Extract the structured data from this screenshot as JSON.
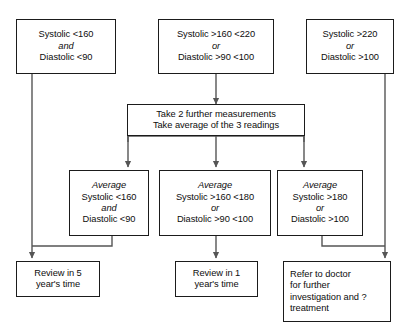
{
  "diagram": {
    "line_color": "#555555",
    "box_border_color": "#1b1b1b",
    "background": "#ffffff"
  },
  "nodes": {
    "bp_low": {
      "id": "bp-low-criteria-box",
      "lines": [
        {
          "text": "Systolic <160",
          "italic": false
        },
        {
          "text": "and",
          "italic": true
        },
        {
          "text": "Diastolic <90",
          "italic": false
        }
      ]
    },
    "bp_mid": {
      "id": "bp-moderate-criteria-box",
      "lines": [
        {
          "text": "Systolic >160 <220",
          "italic": false
        },
        {
          "text": "or",
          "italic": true
        },
        {
          "text": "Diastolic >90 <100",
          "italic": false
        }
      ]
    },
    "bp_high": {
      "id": "bp-high-criteria-box",
      "lines": [
        {
          "text": "Systolic >220",
          "italic": false
        },
        {
          "text": "or",
          "italic": true
        },
        {
          "text": "Diastolic >100",
          "italic": false
        }
      ]
    },
    "further": {
      "id": "take-further-measurements-box",
      "lines": [
        {
          "text": "Take 2 further measurements",
          "italic": false
        },
        {
          "text": "Take average of the 3 readings",
          "italic": false
        }
      ]
    },
    "avg_low": {
      "id": "average-low-box",
      "lines": [
        {
          "text": "Average",
          "italic": true
        },
        {
          "text": "Systolic <160",
          "italic": false
        },
        {
          "text": "and",
          "italic": true
        },
        {
          "text": "Diastolic <90",
          "italic": false
        }
      ]
    },
    "avg_mid": {
      "id": "average-moderate-box",
      "lines": [
        {
          "text": "Average",
          "italic": true
        },
        {
          "text": "Systolic >160 <180",
          "italic": false
        },
        {
          "text": "or",
          "italic": true
        },
        {
          "text": "Diastolic >90 <100",
          "italic": false
        }
      ]
    },
    "avg_high": {
      "id": "average-high-box",
      "lines": [
        {
          "text": "Average",
          "italic": true
        },
        {
          "text": "Systolic >180",
          "italic": false
        },
        {
          "text": "or",
          "italic": true
        },
        {
          "text": "Diastolic >100",
          "italic": false
        }
      ]
    },
    "review5": {
      "id": "review-5-years-box",
      "lines": [
        {
          "text": "Review in 5",
          "italic": false
        },
        {
          "text": "year's time",
          "italic": false
        }
      ]
    },
    "review1": {
      "id": "review-1-year-box",
      "lines": [
        {
          "text": "Review in 1",
          "italic": false
        },
        {
          "text": "year's time",
          "italic": false
        }
      ]
    },
    "refer": {
      "id": "refer-to-doctor-box",
      "lines": [
        {
          "text": "Refer to doctor",
          "italic": false
        },
        {
          "text": "for further",
          "italic": false
        },
        {
          "text": "investigation and ?",
          "italic": false
        },
        {
          "text": "treatment",
          "italic": false
        }
      ]
    }
  },
  "edges": [
    {
      "name": "bp-low-to-review5",
      "from": "bp_low",
      "to": "review5"
    },
    {
      "name": "bp-mid-to-further",
      "from": "bp_mid",
      "to": "further"
    },
    {
      "name": "bp-high-to-refer",
      "from": "bp_high",
      "to": "refer"
    },
    {
      "name": "further-to-average-low",
      "from": "further",
      "to": "avg_low"
    },
    {
      "name": "further-to-average-moderate",
      "from": "further",
      "to": "avg_mid"
    },
    {
      "name": "further-to-average-high",
      "from": "further",
      "to": "avg_high"
    },
    {
      "name": "average-low-to-review5",
      "from": "avg_low",
      "to": "review5"
    },
    {
      "name": "average-moderate-to-review1",
      "from": "avg_mid",
      "to": "review1"
    },
    {
      "name": "average-high-to-refer",
      "from": "avg_high",
      "to": "refer"
    }
  ]
}
